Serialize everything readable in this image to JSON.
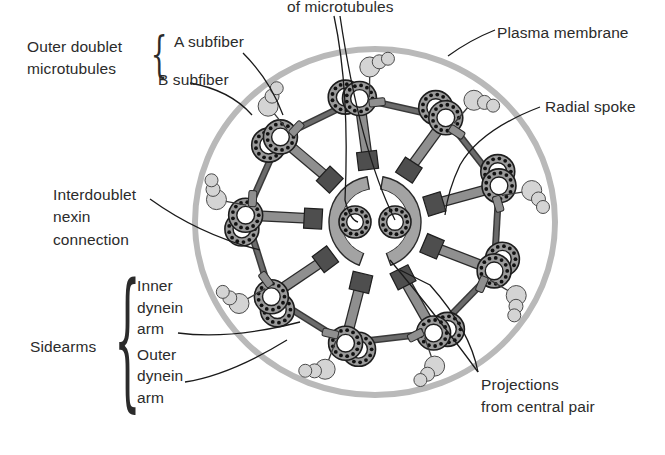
{
  "labels": {
    "central_pair": "of microtubules",
    "plasma_membrane": "Plasma membrane",
    "outer_doublet_line1": "Outer doublet",
    "outer_doublet_line2": "microtubules",
    "a_subfiber": "A subfiber",
    "b_subfiber": "B subfiber",
    "radial_spoke": "Radial spoke",
    "nexin_line1": "Interdoublet",
    "nexin_line2": "nexin",
    "nexin_line3": "connection",
    "sidearms": "Sidearms",
    "inner_dynein_line1": "Inner",
    "inner_dynein_line2": "dynein",
    "inner_dynein_line3": "arm",
    "outer_dynein_line1": "Outer",
    "outer_dynein_line2": "dynein",
    "outer_dynein_line3": "arm",
    "projections_line1": "Projections",
    "projections_line2": "from central pair"
  },
  "colors": {
    "membrane": "#b9b9b9",
    "tubule_fill": "#9a9a9a",
    "tubule_stroke": "#1e1e1e",
    "tubule_dots": "#111111",
    "spoke": "#8f8f8f",
    "spoke_head": "#4e4e4e",
    "sheath": "#a3a3a3",
    "dynein": "#d4d4d4",
    "line": "#1a1a1a"
  },
  "geometry": {
    "center": [
      375,
      222
    ],
    "membrane_rx": 180,
    "membrane_ry": 173,
    "doublet_ring_radius": 127,
    "doublet_count": 9,
    "sheath_radius": 46
  }
}
